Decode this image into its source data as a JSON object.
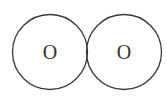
{
  "diagram": {
    "type": "overlapping-atom-circles",
    "atoms": [
      {
        "label": "O",
        "cx": 50,
        "cy": 52,
        "r": 37.5
      },
      {
        "label": "O",
        "cx": 124,
        "cy": 52,
        "r": 37.5
      }
    ],
    "colors": {
      "stroke": "#3a3a3a",
      "text": "#333333",
      "background": "#ffffff"
    }
  }
}
